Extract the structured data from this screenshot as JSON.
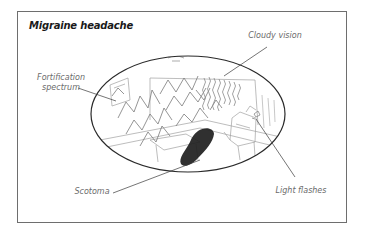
{
  "figure": {
    "title": "Migraine headache",
    "labels": {
      "fortification_line1": "Fortification",
      "fortification_line2": "spectrum",
      "cloudy_vision": "Cloudy vision",
      "scotoma": "Scotoma",
      "light_flashes": "Light flashes"
    },
    "colors": {
      "frame": "#6e6e6e",
      "ellipse": "#2a2a2a",
      "sketch": "#9a9a9a",
      "scotoma": "#1a1a1a",
      "label_text": "#6b6b6b",
      "title_text": "#1a1a1a"
    }
  }
}
